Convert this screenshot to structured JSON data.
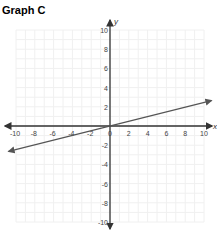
{
  "title": "Graph C",
  "chart_data": {
    "type": "line",
    "title": "Graph C",
    "xlabel": "x",
    "ylabel": "y",
    "xlim": [
      -10,
      10
    ],
    "ylim": [
      -10,
      10
    ],
    "grid": true,
    "x_ticks": [
      -10,
      -8,
      -6,
      -4,
      -2,
      0,
      2,
      4,
      6,
      8,
      10
    ],
    "y_ticks": [
      -10,
      -8,
      -6,
      -4,
      -2,
      2,
      4,
      6,
      8,
      10
    ],
    "series": [
      {
        "name": "line",
        "x": [
          -11,
          11
        ],
        "y": [
          -2.75,
          2.75
        ],
        "equation": "y = 0.25x",
        "arrows_both_ends": true
      }
    ],
    "colors": {
      "axis": "#333333",
      "line": "#555555",
      "grid": "#f0f0f0"
    }
  }
}
